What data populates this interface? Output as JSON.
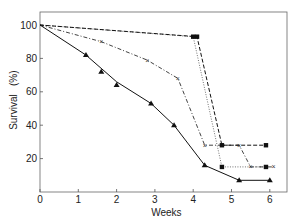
{
  "chart_data": {
    "type": "line",
    "title": "",
    "xlabel": "Weeks",
    "ylabel": "Survival   (%)",
    "xlim": [
      0,
      6.4
    ],
    "ylim": [
      0,
      108
    ],
    "xticks": [
      0,
      1,
      2,
      3,
      4,
      5,
      6
    ],
    "yticks": [
      20,
      40,
      60,
      80,
      100
    ],
    "xtick_labels": [
      "0",
      "1",
      "2",
      "3",
      "4",
      "5",
      "6"
    ],
    "ytick_labels": [
      "20",
      "40",
      "60",
      "80",
      "100"
    ],
    "grid": false,
    "legend": null,
    "series": [
      {
        "name": "triangle-solid",
        "marker": "triangle",
        "line_style": "solid",
        "line": [
          [
            0,
            100
          ],
          [
            1.2,
            82
          ],
          [
            2.0,
            66
          ],
          [
            2.9,
            53
          ],
          [
            3.5,
            40
          ],
          [
            4.3,
            16
          ],
          [
            5.2,
            7
          ],
          [
            6.0,
            7
          ]
        ],
        "points": [
          [
            1.2,
            82
          ],
          [
            1.6,
            72
          ],
          [
            2.0,
            64
          ],
          [
            2.9,
            53
          ],
          [
            3.5,
            40
          ],
          [
            4.3,
            16
          ],
          [
            5.2,
            7
          ],
          [
            6.0,
            7
          ]
        ]
      },
      {
        "name": "square-dashed",
        "marker": "square",
        "line_style": "dashed",
        "line": [
          [
            0,
            100
          ],
          [
            4.1,
            93
          ],
          [
            4.75,
            28
          ],
          [
            5.9,
            28
          ]
        ],
        "points": [
          [
            4.1,
            93
          ],
          [
            4.75,
            28
          ],
          [
            5.9,
            28
          ]
        ]
      },
      {
        "name": "square-dotted",
        "marker": "square",
        "line_style": "dotted",
        "line": [
          [
            0,
            100
          ],
          [
            4.0,
            93
          ],
          [
            4.75,
            15
          ],
          [
            5.9,
            15
          ]
        ],
        "points": [
          [
            4.0,
            93
          ],
          [
            4.75,
            15
          ],
          [
            5.9,
            15
          ]
        ]
      },
      {
        "name": "cross-dashdot",
        "marker": "x",
        "line_style": "dashdot",
        "line": [
          [
            0,
            100
          ],
          [
            1.6,
            90
          ],
          [
            2.8,
            79
          ],
          [
            3.6,
            68
          ],
          [
            4.3,
            28
          ],
          [
            5.2,
            28
          ],
          [
            5.5,
            15
          ],
          [
            6.1,
            15
          ]
        ],
        "points": [
          [
            1.6,
            90
          ],
          [
            2.8,
            79
          ],
          [
            3.6,
            68
          ],
          [
            4.3,
            28
          ],
          [
            5.2,
            28
          ],
          [
            5.5,
            15
          ],
          [
            6.1,
            15
          ]
        ]
      }
    ]
  },
  "layout": {
    "plot_left": 40,
    "plot_right": 287,
    "plot_top": 12,
    "plot_bottom": 192,
    "x_px_per_unit": 38.3,
    "y_px_per_unit": 1.67,
    "axis_color": "#555555",
    "line_color": "#111111"
  }
}
